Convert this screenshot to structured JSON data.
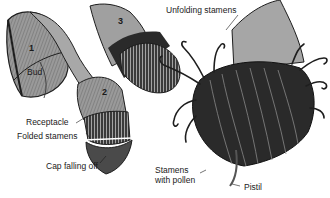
{
  "diagram": {
    "colors": {
      "fill": "#9a9a9a",
      "dark": "#1e1e1e",
      "mid": "#6a6a6a",
      "light": "#c4c4c4",
      "text": "#1a1a1a",
      "background": "#ffffff"
    },
    "stages": [
      {
        "number": "1",
        "name": "bud"
      },
      {
        "number": "2",
        "name": "cap-falling"
      },
      {
        "number": "3",
        "name": "unfolding"
      }
    ],
    "labels": [
      {
        "id": "bud",
        "text": "Bud"
      },
      {
        "id": "receptacle",
        "text": "Receptacle"
      },
      {
        "id": "folded-stamens",
        "text": "Folded stamens"
      },
      {
        "id": "cap-falling-off",
        "text": "Cap falling off"
      },
      {
        "id": "unfolding-stamens",
        "text": "Unfolding stamens"
      },
      {
        "id": "stamens-with-pollen",
        "text": "Stamens\nwith pollen"
      },
      {
        "id": "pistil",
        "text": "Pistil"
      }
    ]
  }
}
